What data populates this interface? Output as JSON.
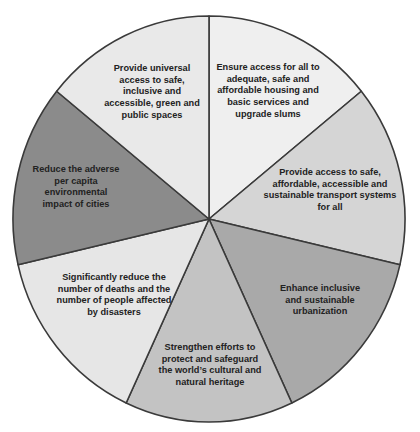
{
  "chart_data": {
    "type": "pie",
    "title": "",
    "center": [
      209,
      219
    ],
    "radius": [
      196,
      203
    ],
    "start_angle_deg": -90,
    "stroke_color": "#3a3a3a",
    "slices": [
      {
        "label": "Ensure access for all to adequate, safe and affordable housing and basic services and upgrade slums",
        "lines": "Ensure access for all to\nadequate, safe and\naffordable housing and\nbasic services and\nupgrade slums",
        "value": 1,
        "start": -90,
        "end": -39,
        "color": "#efefef",
        "label_box": {
          "left": 212,
          "top": 62,
          "width": 112
        }
      },
      {
        "label": "Provide access to safe, affordable, accessible and sustainable transport systems for all",
        "lines": "Provide access to safe,\naffordable, accessible and\nsustainable transport systems\nfor all",
        "value": 1,
        "start": -39,
        "end": 13,
        "color": "#d5d5d5",
        "label_box": {
          "left": 262,
          "top": 167,
          "width": 136
        }
      },
      {
        "label": "Enhance inclusive and sustainable urbanization",
        "lines": "Enhance inclusive\nand sustainable\nurbanization",
        "value": 1,
        "start": 13,
        "end": 65,
        "color": "#a9a9a9",
        "label_box": {
          "left": 272,
          "top": 283,
          "width": 96
        }
      },
      {
        "label": "Strengthen efforts to protect and safeguard the world's cultural and natural heritage",
        "lines": "Strengthen efforts to\nprotect and safeguard\nthe world’s cultural and\nnatural heritage",
        "value": 1,
        "start": 65,
        "end": 115,
        "color": "#c3c3c3",
        "label_box": {
          "left": 153,
          "top": 342,
          "width": 114
        }
      },
      {
        "label": "Significantly reduce the number of deaths and the number of people affected by disasters",
        "lines": "Significantly  reduce the\nnumber of deaths and the\nnumber of people affected\nby disasters",
        "value": 1,
        "start": 115,
        "end": 167,
        "color": "#e6e6e6",
        "label_box": {
          "left": 52,
          "top": 272,
          "width": 124
        }
      },
      {
        "label": "Reduce the adverse per capita environmental impact of cities",
        "lines": "Reduce the adverse\nper capita\nenvironmental\nimpact of cities",
        "value": 1,
        "start": 167,
        "end": 219,
        "color": "#8b8b8b",
        "label_box": {
          "left": 26,
          "top": 164,
          "width": 100
        }
      },
      {
        "label": "Provide universal access to safe, inclusive and accessible, green and public spaces",
        "lines": "Provide universal\naccess to safe,\ninclusive and\naccessible, green and\npublic spaces",
        "value": 1,
        "start": 219,
        "end": 270,
        "color": "#e9e9e9",
        "label_box": {
          "left": 104,
          "top": 63,
          "width": 96
        }
      }
    ]
  }
}
